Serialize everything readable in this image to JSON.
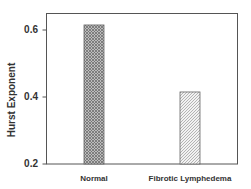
{
  "chart_data": {
    "type": "bar",
    "title": "",
    "xlabel": "",
    "ylabel": "Hurst Exponent",
    "categories": [
      "Normal",
      "Fibrotic Lymphedema"
    ],
    "values": [
      0.615,
      0.415
    ],
    "ylim": [
      0.2,
      0.65
    ],
    "yticks": [
      "0.2",
      "0.4",
      "0.6"
    ],
    "grid": false,
    "legend": null,
    "bar_patterns": [
      "crosshatch-dense",
      "diagonal-hatch"
    ],
    "colors": {
      "axis": "#555555",
      "bar_stroke": "#555555",
      "text": "#333333"
    }
  }
}
